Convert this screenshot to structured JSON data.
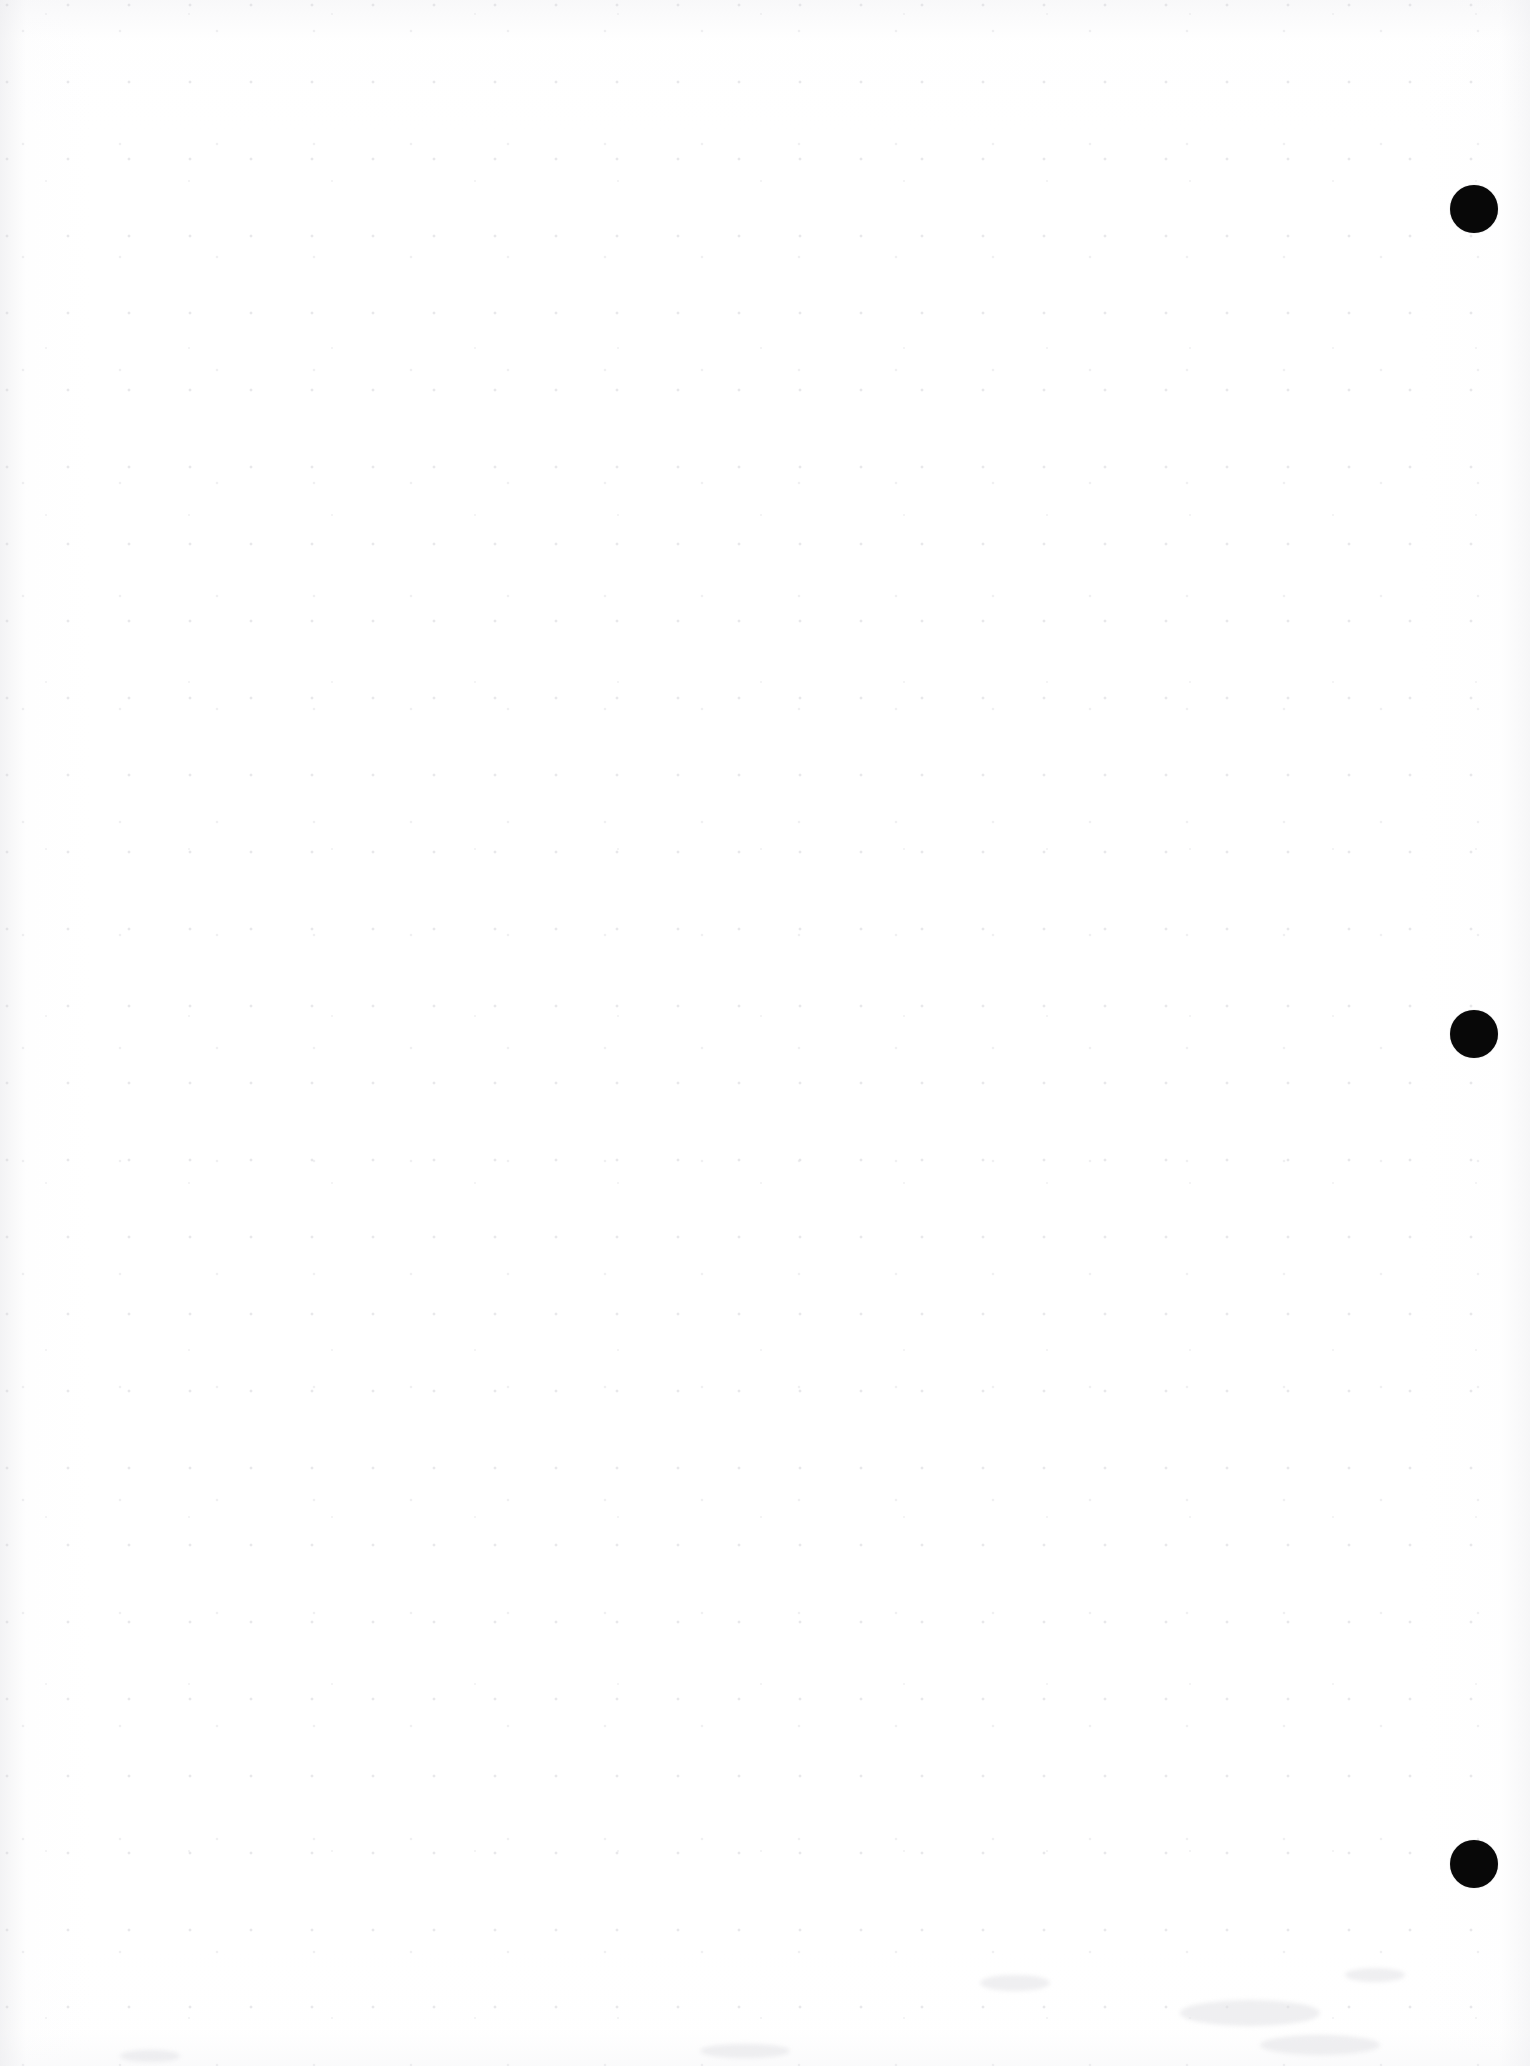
{
  "document": {
    "page_background_color": "#ffffff",
    "ink_color": "#080808",
    "page_width_px": 1530,
    "page_height_px": 2066,
    "content_text": "",
    "body_text": "",
    "header_text": "",
    "footer_text": "",
    "page_number_text": "",
    "notes_text": ""
  },
  "marks": {
    "label": "binding registration dots",
    "count": 3,
    "color": "#080808",
    "items": [
      {
        "name": "dot-top",
        "cx": 1474,
        "cy": 209,
        "d": 48
      },
      {
        "name": "dot-middle",
        "cx": 1474,
        "cy": 1034,
        "d": 48
      },
      {
        "name": "dot-bottom",
        "cx": 1474,
        "cy": 1864,
        "d": 48
      }
    ]
  },
  "artifacts": {
    "smudges": [
      {
        "x": 1180,
        "y": 2000,
        "w": 140,
        "h": 26
      },
      {
        "x": 1260,
        "y": 2035,
        "w": 120,
        "h": 20
      },
      {
        "x": 980,
        "y": 1975,
        "w": 70,
        "h": 16
      },
      {
        "x": 1345,
        "y": 1968,
        "w": 60,
        "h": 14
      },
      {
        "x": 700,
        "y": 2044,
        "w": 90,
        "h": 14
      },
      {
        "x": 120,
        "y": 2050,
        "w": 60,
        "h": 12
      }
    ]
  }
}
